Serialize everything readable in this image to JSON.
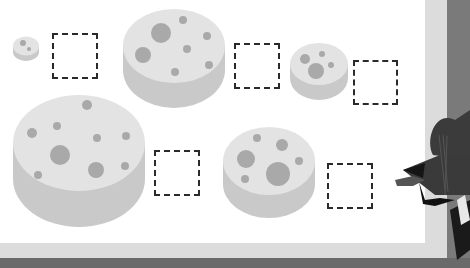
{
  "scene": {
    "description": "Cheese size ordering activity on a whiteboard",
    "colors": {
      "board": "#ffffff",
      "frame": "#dcdcdc",
      "outer": "#7a7a7a",
      "cheese_top": "#e3e3e3",
      "cheese_side": "#c9c9c9",
      "cheese_hole": "#a9a9a9",
      "slot_border": "#2a2a2a"
    }
  },
  "cheeses": [
    {
      "id": "cheese-tiny",
      "size_rank": "smallest"
    },
    {
      "id": "cheese-large",
      "size_rank": "large"
    },
    {
      "id": "cheese-small",
      "size_rank": "small"
    },
    {
      "id": "cheese-huge",
      "size_rank": "largest"
    },
    {
      "id": "cheese-medium",
      "size_rank": "medium"
    }
  ],
  "answer_slots": [
    {
      "id": "slot-1",
      "value": ""
    },
    {
      "id": "slot-2",
      "value": ""
    },
    {
      "id": "slot-3",
      "value": ""
    },
    {
      "id": "slot-4",
      "value": ""
    },
    {
      "id": "slot-5",
      "value": ""
    }
  ],
  "character": {
    "name": "cat-character",
    "partially_visible": true
  }
}
